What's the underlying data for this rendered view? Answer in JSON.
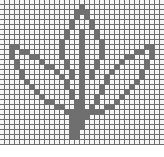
{
  "grid": {
    "cols": 33,
    "rows": 29,
    "cell_size_px": 5,
    "line_color": "#6e6e6e",
    "empty_color": "#f4f4f4",
    "fill_color": "#6f6f6f"
  },
  "filled_rows": [
    [],
    [
      16
    ],
    [
      15,
      16,
      17
    ],
    [
      15,
      17
    ],
    [
      14,
      18
    ],
    [
      14,
      18
    ],
    [
      13,
      16,
      19
    ],
    [
      13,
      16,
      19
    ],
    [
      12,
      16,
      20
    ],
    [
      2,
      3,
      12,
      16,
      20,
      29,
      30
    ],
    [
      2,
      4,
      5,
      12,
      16,
      20,
      27,
      28,
      30
    ],
    [
      2,
      6,
      7,
      12,
      16,
      20,
      25,
      26,
      30
    ],
    [
      3,
      8,
      13,
      16,
      19,
      24,
      29
    ],
    [
      3,
      9,
      10,
      13,
      16,
      19,
      23,
      29
    ],
    [
      4,
      11,
      14,
      16,
      18,
      22,
      28
    ],
    [
      4,
      12,
      14,
      16,
      18,
      21,
      28
    ],
    [
      5,
      13,
      16,
      21,
      27
    ],
    [
      6,
      13,
      16,
      20,
      26
    ],
    [
      7,
      14,
      16,
      20,
      25
    ],
    [
      8,
      14,
      16,
      19,
      24
    ],
    [
      9,
      10,
      15,
      16,
      19,
      23
    ],
    [
      11,
      12,
      15,
      16,
      18,
      21,
      22
    ],
    [
      13,
      14,
      15,
      16,
      17,
      18,
      19,
      20
    ],
    [
      14,
      15,
      16,
      17
    ],
    [
      14,
      15,
      16
    ],
    [
      14,
      15,
      16
    ],
    [
      14,
      15
    ],
    [
      14,
      15
    ],
    []
  ]
}
